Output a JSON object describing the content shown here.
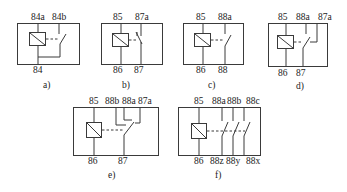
{
  "figure": {
    "panels": [
      {
        "id": "a",
        "caption": "a)",
        "top_pins": [
          "84a",
          "84b"
        ],
        "bottom_pins": [
          "84"
        ],
        "contact": "single normally-open contact"
      },
      {
        "id": "b",
        "caption": "b)",
        "top_pins": [
          "85",
          "87a"
        ],
        "bottom_pins": [
          "86",
          "87"
        ],
        "contact": "single normally-closed contact"
      },
      {
        "id": "c",
        "caption": "c)",
        "top_pins": [
          "85",
          "88a"
        ],
        "bottom_pins": [
          "86",
          "88"
        ],
        "contact": "single normally-open contact"
      },
      {
        "id": "d",
        "caption": "d)",
        "top_pins": [
          "85",
          "88a",
          "87a"
        ],
        "bottom_pins": [
          "86",
          "87"
        ],
        "contact": "changeover contact"
      },
      {
        "id": "e",
        "caption": "e)",
        "top_pins": [
          "85",
          "88b",
          "88a",
          "87a"
        ],
        "bottom_pins": [
          "86",
          "87"
        ],
        "contact": "multi-throw changeover contact"
      },
      {
        "id": "f",
        "caption": "f)",
        "top_pins": [
          "85",
          "88a",
          "88b",
          "88c"
        ],
        "bottom_pins": [
          "86",
          "88z",
          "88y",
          "88x"
        ],
        "contact": "three normally-open contacts"
      }
    ],
    "colors": {
      "line": "#3a3a3a",
      "text": "#222222",
      "background": "#ffffff"
    }
  }
}
